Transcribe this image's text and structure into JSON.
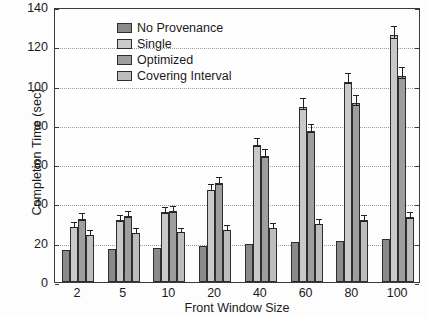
{
  "chart_data": {
    "type": "bar",
    "title": "",
    "xlabel": "Front Window Size",
    "ylabel": "Completion Time (sec)",
    "categories": [
      "2",
      "5",
      "10",
      "20",
      "40",
      "60",
      "80",
      "100"
    ],
    "ylim": [
      0,
      140
    ],
    "yticks": [
      0,
      20,
      40,
      60,
      80,
      100,
      120,
      140
    ],
    "grid": true,
    "legend_position": "upper-left-inside",
    "series": [
      {
        "name": "No Provenance",
        "color": "#8a8a8a",
        "values": [
          16.5,
          17.0,
          17.5,
          18.5,
          19.5,
          20.5,
          21.0,
          22.0
        ],
        "errors": [
          0,
          0,
          0,
          0,
          0,
          0,
          0,
          0
        ]
      },
      {
        "name": "Single",
        "color": "#c9c9c9",
        "values": [
          28.0,
          31.5,
          35.5,
          47.0,
          70.0,
          89.0,
          102.0,
          125.5
        ],
        "errors": [
          2.0,
          2.0,
          2.0,
          2.5,
          3.0,
          4.0,
          4.0,
          4.5
        ]
      },
      {
        "name": "Optimized",
        "color": "#9e9e9e",
        "values": [
          32.0,
          33.5,
          36.0,
          50.5,
          64.0,
          77.0,
          91.0,
          105.0
        ],
        "errors": [
          2.5,
          2.0,
          2.0,
          2.5,
          3.0,
          3.0,
          3.5,
          4.0
        ]
      },
      {
        "name": "Covering Interval",
        "color": "#bdbdbd",
        "values": [
          24.0,
          25.0,
          25.5,
          26.5,
          27.5,
          29.5,
          31.5,
          33.0
        ],
        "errors": [
          2.0,
          2.0,
          1.5,
          2.0,
          2.0,
          2.0,
          2.0,
          2.0
        ]
      }
    ]
  }
}
